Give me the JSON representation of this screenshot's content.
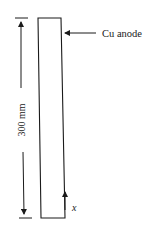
{
  "diagram": {
    "type": "electrode-schematic",
    "anode_label": "Cu anode",
    "dimension_label": "300 mm",
    "axis_label": "x",
    "colors": {
      "stroke": "#1a1a1a",
      "background": "#ffffff"
    }
  }
}
